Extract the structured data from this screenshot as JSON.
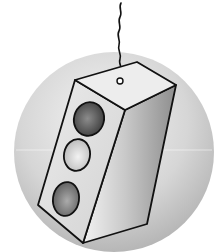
{
  "illustration": {
    "subject": "hanging traffic light",
    "background_color": "#ffffff",
    "sphere": {
      "cx": 114,
      "cy": 150,
      "r": 100,
      "highlight_color": "#f2f2f2",
      "shadow_color": "#b5b5b5"
    },
    "wire": {
      "stroke": "#111111"
    },
    "box": {
      "outline": "#111111",
      "top_face_color": "#ececec",
      "front_face_color": "#e4e4e4",
      "side_face_light": "#efefef",
      "side_face_dark": "#9a9a9a"
    },
    "lights": [
      {
        "name": "top-light",
        "fill_center": "#8a8a8a",
        "fill_edge": "#3c3c3c"
      },
      {
        "name": "middle-light",
        "fill_center": "#f0f0f0",
        "fill_edge": "#bdbdbd"
      },
      {
        "name": "bottom-light",
        "fill_center": "#a8a8a8",
        "fill_edge": "#5f5f5f"
      }
    ]
  }
}
